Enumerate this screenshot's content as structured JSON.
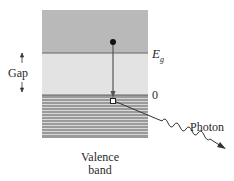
{
  "diagram": {
    "labels": {
      "conduction_edge": "E",
      "conduction_edge_sub": "g",
      "valence_edge": "0",
      "gap": "Gap",
      "photon": "Photon",
      "valence_line1": "Valence",
      "valence_line2": "band"
    },
    "colors": {
      "conduction_band": "#b9b9b9",
      "gap": "#e3e3e3",
      "valence_band": "#9a9a9a",
      "valence_stripe": "#d8d8d8",
      "lines": "#555555",
      "electron": "#111111",
      "hole": "#ffffff"
    },
    "elements": {
      "electron": "filled dot in conduction band",
      "hole": "open square at top of valence band",
      "transition": "downward arrow from electron to hole",
      "photon": "wavy arrow emitted to the lower right"
    }
  }
}
